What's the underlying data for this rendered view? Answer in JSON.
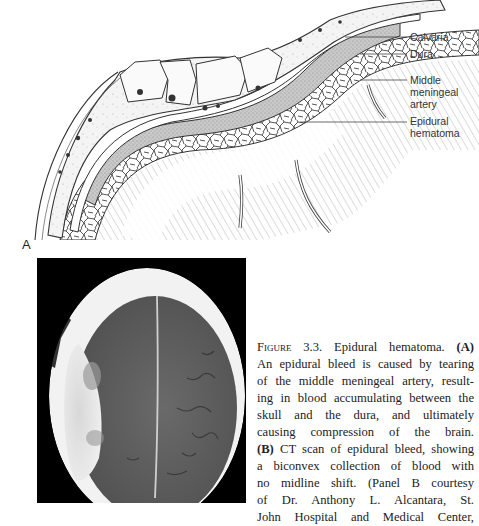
{
  "figure": {
    "panel_a_label": "A",
    "callouts": [
      {
        "id": "calvaria",
        "lines": [
          "Calvaria"
        ]
      },
      {
        "id": "dura",
        "lines": [
          "Dura"
        ]
      },
      {
        "id": "middle-meningeal-artery",
        "lines": [
          "Middle",
          "meningeal",
          "artery"
        ]
      },
      {
        "id": "epidural-hematoma",
        "lines": [
          "Epidural",
          "hematoma"
        ]
      }
    ],
    "caption": {
      "figure_word": "Figure",
      "figure_number": "3.3.",
      "title": "Epidural hematoma.",
      "panel_a_marker": "(A)",
      "panel_b_marker": "(B)",
      "lines": [
        "An epidural bleed is caused by tearing",
        "of the middle meningeal artery, result-",
        "ing in blood accumulating between the",
        "skull and the dura, and ultimately",
        "causing compression of the brain.",
        "CT scan of epidural bleed, showing",
        "a biconvex collection of blood with",
        "no midline shift. (Panel B courtesy",
        "of Dr. Anthony L. Alcantara, St.",
        "John Hospital and Medical Center,"
      ]
    }
  }
}
